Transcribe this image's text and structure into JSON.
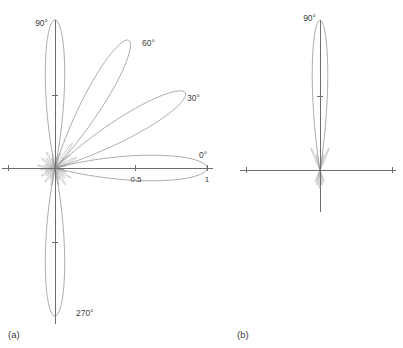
{
  "figure": {
    "background_color": "#ffffff",
    "curve_color": "#8a8a8a",
    "axis_color": "#6e6e6e",
    "text_color": "#3f3f3f"
  },
  "panels": [
    {
      "id": "a",
      "caption": "(a)",
      "caption_x": 8,
      "caption_y": 338,
      "origin": {
        "x": 55,
        "y": 168
      },
      "radius_px": 152,
      "axes": {
        "horizontal": {
          "x1": 2,
          "y1": 168,
          "x2": 213,
          "y2": 168
        },
        "vertical": {
          "x1": 55,
          "y1": 20,
          "x2": 55,
          "y2": 324
        },
        "ticks": [
          {
            "name": "tick-right-1",
            "x": 207,
            "y": 168,
            "orient": "v",
            "len": 6
          },
          {
            "name": "tick-right-0.5",
            "x": 135,
            "y": 168,
            "orient": "v",
            "len": 6
          },
          {
            "name": "tick-left-1",
            "x": 8,
            "y": 168,
            "orient": "v",
            "len": 6
          },
          {
            "name": "tick-up-0.5",
            "x": 55,
            "y": 95,
            "orient": "h",
            "len": 6
          },
          {
            "name": "tick-down-0.5",
            "x": 55,
            "y": 242,
            "orient": "h",
            "len": 6
          }
        ]
      },
      "labels": [
        {
          "name": "angle-label-90",
          "text": "90°",
          "x": 48,
          "y": 26,
          "anchor": "end"
        },
        {
          "name": "angle-label-60",
          "text": "60°",
          "x": 142,
          "y": 46,
          "anchor": "start"
        },
        {
          "name": "angle-label-30",
          "text": "30°",
          "x": 187,
          "y": 101,
          "anchor": "start"
        },
        {
          "name": "angle-label-0",
          "text": "0°",
          "x": 199,
          "y": 158,
          "anchor": "start"
        },
        {
          "name": "angle-label-270",
          "text": "270°",
          "x": 76,
          "y": 316,
          "anchor": "start"
        },
        {
          "name": "radial-tick-label-0.5",
          "text": "0.5",
          "x": 136,
          "y": 182,
          "anchor": "middle",
          "size": "tick"
        },
        {
          "name": "radial-tick-label-1",
          "text": "1",
          "x": 207,
          "y": 182,
          "anchor": "middle",
          "size": "tick"
        }
      ],
      "main_lobes": [
        {
          "name": "lobe-0deg",
          "angle_deg": 0,
          "amplitude": 1.0,
          "width_deg": 15.5
        },
        {
          "name": "lobe-30deg",
          "angle_deg": 30,
          "amplitude": 0.99,
          "width_deg": 14.0
        },
        {
          "name": "lobe-60deg",
          "angle_deg": 60,
          "amplitude": 0.97,
          "width_deg": 13.5
        },
        {
          "name": "lobe-90deg",
          "angle_deg": 90,
          "amplitude": 0.975,
          "width_deg": 12.0
        },
        {
          "name": "lobe-270deg",
          "angle_deg": 270,
          "amplitude": 0.975,
          "width_deg": 12.0
        }
      ],
      "sidelobes": [
        {
          "name": "sidelobe-1",
          "angle_deg": 12,
          "amplitude": 0.075,
          "width_deg": 7
        },
        {
          "name": "sidelobe-2",
          "angle_deg": 19,
          "amplitude": 0.055,
          "width_deg": 6
        },
        {
          "name": "sidelobe-3",
          "angle_deg": 26,
          "amplitude": 0.16,
          "width_deg": 6
        },
        {
          "name": "sidelobe-4",
          "angle_deg": 41,
          "amplitude": 0.13,
          "width_deg": 6
        },
        {
          "name": "sidelobe-5",
          "angle_deg": 48,
          "amplitude": 0.085,
          "width_deg": 6
        },
        {
          "name": "sidelobe-6",
          "angle_deg": 55,
          "amplitude": 0.2,
          "width_deg": 6
        },
        {
          "name": "sidelobe-7",
          "angle_deg": 72,
          "amplitude": 0.105,
          "width_deg": 6
        },
        {
          "name": "sidelobe-8",
          "angle_deg": 80,
          "amplitude": 0.075,
          "width_deg": 6
        },
        {
          "name": "sidelobe-9",
          "angle_deg": 100,
          "amplitude": 0.095,
          "width_deg": 6
        },
        {
          "name": "sidelobe-10",
          "angle_deg": 108,
          "amplitude": 0.065,
          "width_deg": 6
        },
        {
          "name": "sidelobe-11",
          "angle_deg": 118,
          "amplitude": 0.12,
          "width_deg": 7
        },
        {
          "name": "sidelobe-12",
          "angle_deg": 132,
          "amplitude": 0.085,
          "width_deg": 7
        },
        {
          "name": "sidelobe-13",
          "angle_deg": 145,
          "amplitude": 0.11,
          "width_deg": 7
        },
        {
          "name": "sidelobe-14",
          "angle_deg": 158,
          "amplitude": 0.07,
          "width_deg": 7
        },
        {
          "name": "sidelobe-15",
          "angle_deg": 172,
          "amplitude": 0.115,
          "width_deg": 8
        },
        {
          "name": "sidelobe-16",
          "angle_deg": 186,
          "amplitude": 0.095,
          "width_deg": 8
        },
        {
          "name": "sidelobe-17",
          "angle_deg": 198,
          "amplitude": 0.07,
          "width_deg": 7
        },
        {
          "name": "sidelobe-18",
          "angle_deg": 210,
          "amplitude": 0.105,
          "width_deg": 7
        },
        {
          "name": "sidelobe-19",
          "angle_deg": 222,
          "amplitude": 0.075,
          "width_deg": 7
        },
        {
          "name": "sidelobe-20",
          "angle_deg": 235,
          "amplitude": 0.115,
          "width_deg": 7
        },
        {
          "name": "sidelobe-21",
          "angle_deg": 248,
          "amplitude": 0.08,
          "width_deg": 6
        },
        {
          "name": "sidelobe-22",
          "angle_deg": 258,
          "amplitude": 0.12,
          "width_deg": 6
        },
        {
          "name": "sidelobe-23",
          "angle_deg": 282,
          "amplitude": 0.115,
          "width_deg": 6
        },
        {
          "name": "sidelobe-24",
          "angle_deg": 292,
          "amplitude": 0.08,
          "width_deg": 6
        },
        {
          "name": "sidelobe-25",
          "angle_deg": 302,
          "amplitude": 0.13,
          "width_deg": 7
        },
        {
          "name": "sidelobe-26",
          "angle_deg": 315,
          "amplitude": 0.09,
          "width_deg": 7
        },
        {
          "name": "sidelobe-27",
          "angle_deg": 328,
          "amplitude": 0.125,
          "width_deg": 7
        },
        {
          "name": "sidelobe-28",
          "angle_deg": 340,
          "amplitude": 0.08,
          "width_deg": 6
        },
        {
          "name": "sidelobe-29",
          "angle_deg": 350,
          "amplitude": 0.06,
          "width_deg": 6
        }
      ]
    },
    {
      "id": "b",
      "caption": "(b)",
      "caption_x": 237,
      "caption_y": 338,
      "origin": {
        "x": 320,
        "y": 170
      },
      "radius_px": 152,
      "axes": {
        "horizontal": {
          "x1": 240,
          "y1": 170,
          "x2": 396,
          "y2": 170
        },
        "vertical": {
          "x1": 320,
          "y1": 20,
          "x2": 320,
          "y2": 212
        },
        "ticks": [
          {
            "name": "tick-right-1",
            "x": 392,
            "y": 170,
            "orient": "v",
            "len": 6
          },
          {
            "name": "tick-left-1",
            "x": 246,
            "y": 170,
            "orient": "v",
            "len": 6
          },
          {
            "name": "tick-up-0.5",
            "x": 320,
            "y": 96,
            "orient": "h",
            "len": 6
          }
        ]
      },
      "labels": [
        {
          "name": "angle-label-90",
          "text": "90°",
          "x": 316,
          "y": 21,
          "anchor": "end"
        }
      ],
      "main_lobes": [
        {
          "name": "lobe-90deg",
          "angle_deg": 90,
          "amplitude": 0.985,
          "width_deg": 9.5
        }
      ],
      "sidelobes": [
        {
          "name": "sidelobe-1",
          "angle_deg": 68,
          "amplitude": 0.155,
          "width_deg": 5.5
        },
        {
          "name": "sidelobe-2",
          "angle_deg": 77,
          "amplitude": 0.105,
          "width_deg": 5
        },
        {
          "name": "sidelobe-3",
          "angle_deg": 103,
          "amplitude": 0.105,
          "width_deg": 5
        },
        {
          "name": "sidelobe-4",
          "angle_deg": 112,
          "amplitude": 0.155,
          "width_deg": 5.5
        },
        {
          "name": "sidelobe-5",
          "angle_deg": 248,
          "amplitude": 0.085,
          "width_deg": 5
        },
        {
          "name": "sidelobe-6",
          "angle_deg": 258,
          "amplitude": 0.1,
          "width_deg": 5
        },
        {
          "name": "sidelobe-7",
          "angle_deg": 268,
          "amplitude": 0.12,
          "width_deg": 5
        },
        {
          "name": "sidelobe-8",
          "angle_deg": 278,
          "amplitude": 0.1,
          "width_deg": 5
        },
        {
          "name": "sidelobe-9",
          "angle_deg": 288,
          "amplitude": 0.085,
          "width_deg": 5
        }
      ]
    }
  ],
  "chart_data": {
    "type": "line",
    "title": "",
    "subtitle": "",
    "xlabel": "",
    "ylabel": "",
    "rlim": [
      0,
      1
    ],
    "r_ticks": [
      0.5,
      1
    ],
    "r_tick_labels": [
      "0.5",
      "1"
    ],
    "angle_tick_labels": [
      "0°",
      "30°",
      "60°",
      "90°",
      "270°"
    ],
    "grid": false,
    "legend": "none",
    "panels": [
      {
        "name": "(a)",
        "beams_deg": [
          0,
          30,
          60,
          90,
          270
        ],
        "peak_amplitudes": [
          1.0,
          0.99,
          0.97,
          0.975,
          0.975
        ],
        "sidelobe_peak_level": 0.2
      },
      {
        "name": "(b)",
        "beams_deg": [
          90
        ],
        "peak_amplitudes": [
          0.985
        ],
        "sidelobe_peak_level": 0.155
      }
    ]
  }
}
